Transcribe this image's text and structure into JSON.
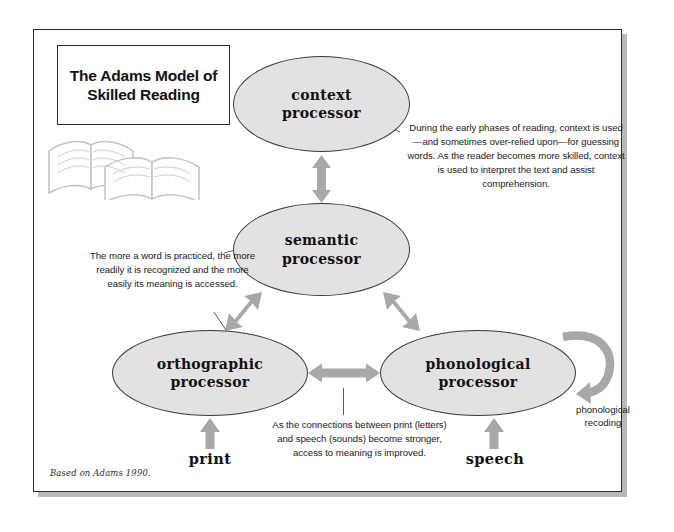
{
  "figure": {
    "title_lines": [
      "The Adams Model of",
      "Skilled Reading"
    ],
    "credit": "Based on Adams 1990.",
    "icon_books": "open-books-icon"
  },
  "nodes": [
    {
      "id": "context",
      "label": "context\nprocessor",
      "label_line1": "context",
      "label_line2": "processor"
    },
    {
      "id": "semantic",
      "label": "semantic\nprocessor",
      "label_line1": "semantic",
      "label_line2": "processor"
    },
    {
      "id": "orthographic",
      "label": "orthographic\nprocessor",
      "label_line1": "orthographic",
      "label_line2": "processor"
    },
    {
      "id": "phonological",
      "label": "phonological\nprocessor",
      "label_line1": "phonological",
      "label_line2": "processor"
    }
  ],
  "inputs": {
    "print": "print",
    "speech": "speech"
  },
  "loop_label": {
    "line1": "phonological",
    "line2": "recoding"
  },
  "annotations": {
    "context_note": "During the early phases of reading, context is used—and sometimes over-relied upon—for guessing words. As the reader becomes more skilled, context is used to interpret the text and assist comprehension.",
    "semantic_note": "The more a word is practiced, the more readily it is recognized and the more easily its meaning is accessed.",
    "connection_note": "As the connections between print (letters) and speech (sounds) become stronger, access to meaning is improved."
  },
  "colors": {
    "ellipse_fill": "#e2e2e2",
    "ellipse_stroke": "#3b3b3b",
    "arrow_fill": "#a8a8a8",
    "frame_stroke": "#2e2e2e",
    "shadow": "#b9b9b9",
    "text": "#1a1a1a"
  }
}
